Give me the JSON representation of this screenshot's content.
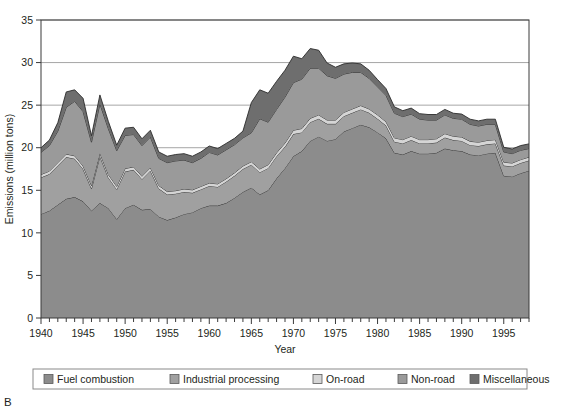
{
  "figure": {
    "panel_label": "B"
  },
  "chart_data": {
    "type": "area",
    "stacked": true,
    "title": "",
    "xlabel": "Year",
    "ylabel": "Emissions (million tons)",
    "xlim": [
      1940,
      1998
    ],
    "ylim": [
      0,
      35
    ],
    "ytick_step": 5,
    "xtick_step": 5,
    "xtick_minor_step": 1,
    "grid": "horizontal",
    "legend_position": "bottom",
    "yticks": [
      0,
      5,
      10,
      15,
      20,
      25,
      30,
      35
    ],
    "xticks": [
      1940,
      1945,
      1950,
      1955,
      1960,
      1965,
      1970,
      1975,
      1980,
      1985,
      1990,
      1995
    ],
    "x": [
      1940,
      1941,
      1942,
      1943,
      1944,
      1945,
      1946,
      1947,
      1948,
      1949,
      1950,
      1951,
      1952,
      1953,
      1954,
      1955,
      1956,
      1957,
      1958,
      1959,
      1960,
      1961,
      1962,
      1963,
      1964,
      1965,
      1966,
      1967,
      1968,
      1969,
      1970,
      1971,
      1972,
      1973,
      1974,
      1975,
      1976,
      1977,
      1978,
      1979,
      1980,
      1981,
      1982,
      1983,
      1984,
      1985,
      1986,
      1987,
      1988,
      1989,
      1990,
      1991,
      1992,
      1993,
      1994,
      1995,
      1996,
      1997,
      1998
    ],
    "series": [
      {
        "name": "Fuel combustion",
        "color": "#8c8c8c",
        "values": [
          12.2,
          12.6,
          13.3,
          14.0,
          14.2,
          13.7,
          12.6,
          13.5,
          12.9,
          11.6,
          12.9,
          13.3,
          12.7,
          12.8,
          11.9,
          11.5,
          11.8,
          12.2,
          12.4,
          12.9,
          13.2,
          13.2,
          13.5,
          14.1,
          14.8,
          15.3,
          14.5,
          15.0,
          16.4,
          17.6,
          19.0,
          19.6,
          20.8,
          21.3,
          20.8,
          21.0,
          21.9,
          22.3,
          22.7,
          22.4,
          21.8,
          21.1,
          19.4,
          19.2,
          19.6,
          19.3,
          19.3,
          19.4,
          19.9,
          19.7,
          19.6,
          19.2,
          19.1,
          19.3,
          19.4,
          16.7,
          16.6,
          17.0,
          17.3
        ]
      },
      {
        "name": "Industrial processing",
        "color": "#a0a0a0",
        "values": [
          4.3,
          4.3,
          4.6,
          4.9,
          4.5,
          3.8,
          2.6,
          5.5,
          3.6,
          3.5,
          4.3,
          4.1,
          3.6,
          4.5,
          3.3,
          3.0,
          2.8,
          2.6,
          2.3,
          2.2,
          2.3,
          2.2,
          2.5,
          2.6,
          2.7,
          2.7,
          2.6,
          2.6,
          2.6,
          2.5,
          2.6,
          2.2,
          2.2,
          2.1,
          2.0,
          1.8,
          1.8,
          1.8,
          1.8,
          1.7,
          1.6,
          1.5,
          1.3,
          1.3,
          1.3,
          1.2,
          1.2,
          1.2,
          1.3,
          1.2,
          1.2,
          1.1,
          1.1,
          1.1,
          1.1,
          1.2,
          1.2,
          1.2,
          1.2
        ]
      },
      {
        "name": "On-road",
        "color": "#d5d5d5",
        "values": [
          0.35,
          0.35,
          0.35,
          0.35,
          0.35,
          0.35,
          0.35,
          0.35,
          0.35,
          0.35,
          0.35,
          0.35,
          0.35,
          0.35,
          0.35,
          0.35,
          0.35,
          0.35,
          0.35,
          0.35,
          0.35,
          0.35,
          0.35,
          0.35,
          0.35,
          0.35,
          0.4,
          0.4,
          0.4,
          0.45,
          0.45,
          0.45,
          0.45,
          0.45,
          0.45,
          0.45,
          0.45,
          0.45,
          0.45,
          0.45,
          0.45,
          0.45,
          0.45,
          0.45,
          0.45,
          0.45,
          0.45,
          0.45,
          0.45,
          0.45,
          0.45,
          0.45,
          0.45,
          0.45,
          0.45,
          0.4,
          0.4,
          0.4,
          0.4
        ]
      },
      {
        "name": "Non-road",
        "color": "#9a9a9a",
        "values": [
          2.6,
          3.0,
          3.7,
          5.5,
          6.4,
          6.4,
          5.1,
          5.8,
          5.4,
          4.2,
          3.9,
          3.8,
          3.6,
          3.6,
          3.2,
          3.4,
          3.5,
          3.4,
          3.2,
          3.3,
          3.6,
          3.4,
          3.4,
          3.3,
          3.3,
          3.4,
          5.9,
          5.0,
          5.1,
          5.4,
          5.6,
          5.8,
          5.9,
          5.5,
          5.2,
          4.9,
          4.5,
          4.3,
          3.9,
          3.6,
          3.3,
          3.1,
          2.9,
          2.7,
          2.6,
          2.4,
          2.3,
          2.2,
          2.2,
          2.1,
          2.1,
          2.0,
          1.9,
          1.9,
          1.8,
          1.2,
          1.1,
          1.1,
          1.0
        ]
      },
      {
        "name": "Miscellaneous",
        "color": "#6e6e6e",
        "values": [
          0.55,
          0.65,
          1.0,
          1.8,
          1.35,
          1.55,
          0.75,
          1.05,
          0.85,
          0.65,
          0.85,
          0.85,
          0.8,
          0.8,
          0.75,
          0.75,
          0.75,
          0.75,
          0.75,
          0.75,
          0.75,
          0.75,
          0.75,
          0.75,
          0.8,
          3.55,
          3.4,
          3.4,
          3.3,
          3.15,
          3.1,
          2.4,
          2.3,
          2.1,
          1.5,
          1.3,
          1.2,
          1.1,
          1.0,
          0.95,
          0.85,
          0.8,
          0.75,
          0.7,
          0.7,
          0.65,
          0.65,
          0.65,
          0.65,
          0.6,
          0.6,
          0.6,
          0.6,
          0.6,
          0.6,
          0.55,
          0.55,
          0.55,
          0.55
        ]
      }
    ],
    "legend": [
      {
        "label": "Fuel combustion",
        "color": "#8c8c8c"
      },
      {
        "label": "Industrial processing",
        "color": "#a0a0a0"
      },
      {
        "label": "On-road",
        "color": "#d5d5d5"
      },
      {
        "label": "Non-road",
        "color": "#9a9a9a"
      },
      {
        "label": "Miscellaneous",
        "color": "#6e6e6e"
      }
    ]
  }
}
